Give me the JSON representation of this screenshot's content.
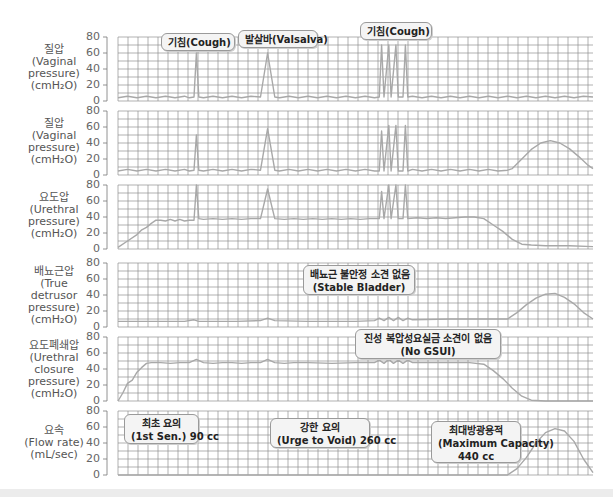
{
  "chart_data": {
    "type": "line",
    "title": "",
    "x_range": [
      0,
      100
    ],
    "grid": true,
    "panels": [
      {
        "id": "vaginal1",
        "ylabel_ko": "질압",
        "ylabel_en": [
          "(Vaginal",
          "pressure)",
          "(cmH₂O)"
        ],
        "yticks": [
          80,
          60,
          40,
          20,
          0
        ],
        "ylim": [
          0,
          80
        ],
        "points": [
          [
            0,
            4
          ],
          [
            2,
            6
          ],
          [
            4,
            4
          ],
          [
            6,
            6
          ],
          [
            8,
            4
          ],
          [
            10,
            6
          ],
          [
            12,
            4
          ],
          [
            14,
            6
          ],
          [
            15,
            4
          ],
          [
            16,
            5
          ],
          [
            16.5,
            60
          ],
          [
            17,
            5
          ],
          [
            18,
            4
          ],
          [
            20,
            6
          ],
          [
            22,
            4
          ],
          [
            24,
            6
          ],
          [
            26,
            4
          ],
          [
            28,
            6
          ],
          [
            30,
            5
          ],
          [
            31.5,
            60
          ],
          [
            33,
            5
          ],
          [
            34,
            4
          ],
          [
            36,
            6
          ],
          [
            38,
            4
          ],
          [
            40,
            6
          ],
          [
            42,
            4
          ],
          [
            44,
            6
          ],
          [
            46,
            4
          ],
          [
            48,
            6
          ],
          [
            50,
            4
          ],
          [
            52,
            6
          ],
          [
            54,
            4
          ],
          [
            55,
            5
          ],
          [
            55.5,
            70
          ],
          [
            56,
            5
          ],
          [
            57,
            70
          ],
          [
            57.5,
            5
          ],
          [
            58.5,
            70
          ],
          [
            59,
            5
          ],
          [
            60,
            5
          ],
          [
            60.5,
            70
          ],
          [
            61,
            5
          ],
          [
            62,
            6
          ],
          [
            64,
            4
          ],
          [
            66,
            6
          ],
          [
            68,
            4
          ],
          [
            70,
            6
          ],
          [
            72,
            4
          ],
          [
            74,
            6
          ],
          [
            76,
            4
          ],
          [
            78,
            6
          ],
          [
            80,
            4
          ],
          [
            82,
            6
          ],
          [
            84,
            4
          ],
          [
            86,
            6
          ],
          [
            88,
            4
          ],
          [
            90,
            6
          ],
          [
            92,
            4
          ],
          [
            94,
            6
          ],
          [
            96,
            4
          ],
          [
            98,
            6
          ],
          [
            100,
            5
          ]
        ]
      },
      {
        "id": "vaginal2",
        "ylabel_ko": "질압",
        "ylabel_en": [
          "(Vaginal",
          "pressure)",
          "(cmH₂O)"
        ],
        "yticks": [
          80,
          60,
          40,
          20,
          0
        ],
        "ylim": [
          0,
          80
        ],
        "points": [
          [
            0,
            5
          ],
          [
            2,
            7
          ],
          [
            4,
            5
          ],
          [
            6,
            7
          ],
          [
            8,
            5
          ],
          [
            10,
            7
          ],
          [
            12,
            5
          ],
          [
            14,
            7
          ],
          [
            15,
            5
          ],
          [
            16,
            6
          ],
          [
            16.5,
            50
          ],
          [
            17,
            6
          ],
          [
            18,
            5
          ],
          [
            20,
            7
          ],
          [
            22,
            5
          ],
          [
            24,
            7
          ],
          [
            26,
            5
          ],
          [
            28,
            7
          ],
          [
            30,
            6
          ],
          [
            31.5,
            58
          ],
          [
            33,
            6
          ],
          [
            34,
            5
          ],
          [
            36,
            7
          ],
          [
            38,
            5
          ],
          [
            40,
            7
          ],
          [
            42,
            5
          ],
          [
            44,
            7
          ],
          [
            46,
            5
          ],
          [
            48,
            7
          ],
          [
            50,
            5
          ],
          [
            52,
            7
          ],
          [
            54,
            5
          ],
          [
            55,
            5
          ],
          [
            55.5,
            55
          ],
          [
            56,
            5
          ],
          [
            57,
            62
          ],
          [
            57.5,
            5
          ],
          [
            58.5,
            62
          ],
          [
            59,
            5
          ],
          [
            60,
            5
          ],
          [
            60.5,
            62
          ],
          [
            61,
            5
          ],
          [
            62,
            7
          ],
          [
            64,
            5
          ],
          [
            66,
            7
          ],
          [
            68,
            5
          ],
          [
            70,
            7
          ],
          [
            72,
            5
          ],
          [
            74,
            7
          ],
          [
            76,
            5
          ],
          [
            78,
            7
          ],
          [
            80,
            5
          ],
          [
            82,
            6
          ],
          [
            83,
            8
          ],
          [
            85,
            20
          ],
          [
            87,
            32
          ],
          [
            89,
            40
          ],
          [
            91,
            43
          ],
          [
            93,
            40
          ],
          [
            95,
            33
          ],
          [
            97,
            23
          ],
          [
            99,
            12
          ],
          [
            100,
            8
          ]
        ]
      },
      {
        "id": "urethral",
        "ylabel_ko": "요도압",
        "ylabel_en": [
          "(Urethral",
          "pressure)",
          "(cmH₂O)"
        ],
        "yticks": [
          80,
          60,
          40,
          20,
          0
        ],
        "ylim": [
          0,
          80
        ],
        "points": [
          [
            0,
            2
          ],
          [
            2,
            10
          ],
          [
            4,
            18
          ],
          [
            5,
            24
          ],
          [
            6,
            27
          ],
          [
            7,
            32
          ],
          [
            8,
            36
          ],
          [
            9,
            36
          ],
          [
            10,
            35
          ],
          [
            11,
            37
          ],
          [
            12,
            35
          ],
          [
            13,
            37
          ],
          [
            14,
            35
          ],
          [
            15,
            36
          ],
          [
            16,
            36
          ],
          [
            16.5,
            80
          ],
          [
            17,
            38
          ],
          [
            18,
            37
          ],
          [
            20,
            38
          ],
          [
            22,
            37
          ],
          [
            24,
            38
          ],
          [
            26,
            37
          ],
          [
            28,
            38
          ],
          [
            30,
            38
          ],
          [
            31.5,
            75
          ],
          [
            33,
            38
          ],
          [
            35,
            37
          ],
          [
            37,
            38
          ],
          [
            39,
            37
          ],
          [
            41,
            38
          ],
          [
            43,
            37
          ],
          [
            45,
            38
          ],
          [
            47,
            37
          ],
          [
            49,
            38
          ],
          [
            51,
            37
          ],
          [
            53,
            38
          ],
          [
            55,
            38
          ],
          [
            55.5,
            72
          ],
          [
            56,
            38
          ],
          [
            57,
            80
          ],
          [
            57.5,
            38
          ],
          [
            58.5,
            80
          ],
          [
            59,
            38
          ],
          [
            60,
            38
          ],
          [
            60.5,
            80
          ],
          [
            61,
            38
          ],
          [
            63,
            39
          ],
          [
            65,
            38
          ],
          [
            67,
            39
          ],
          [
            69,
            38
          ],
          [
            71,
            39
          ],
          [
            73,
            40
          ],
          [
            75,
            40
          ],
          [
            77,
            38
          ],
          [
            79,
            30
          ],
          [
            81,
            22
          ],
          [
            83,
            12
          ],
          [
            85,
            6
          ],
          [
            87,
            5
          ],
          [
            90,
            4
          ],
          [
            95,
            4
          ],
          [
            100,
            3
          ]
        ]
      },
      {
        "id": "detrusor",
        "ylabel_ko": "배뇨근압",
        "ylabel_en": [
          "(True",
          "detrusor",
          "pressure)",
          "(cmH₂O)"
        ],
        "yticks": [
          80,
          60,
          40,
          20,
          0
        ],
        "ylim": [
          0,
          80
        ],
        "points": [
          [
            0,
            7
          ],
          [
            10,
            7
          ],
          [
            14,
            7
          ],
          [
            16,
            9
          ],
          [
            17,
            7
          ],
          [
            25,
            7
          ],
          [
            30,
            8
          ],
          [
            31.5,
            11
          ],
          [
            33,
            8
          ],
          [
            40,
            7
          ],
          [
            50,
            7
          ],
          [
            54,
            8
          ],
          [
            55,
            11
          ],
          [
            56,
            8
          ],
          [
            57,
            12
          ],
          [
            58,
            8
          ],
          [
            59,
            12
          ],
          [
            60,
            8
          ],
          [
            61,
            11
          ],
          [
            62,
            9
          ],
          [
            70,
            10
          ],
          [
            78,
            10
          ],
          [
            82,
            10
          ],
          [
            84,
            18
          ],
          [
            86,
            28
          ],
          [
            88,
            36
          ],
          [
            90,
            41
          ],
          [
            92,
            42
          ],
          [
            94,
            37
          ],
          [
            96,
            29
          ],
          [
            98,
            18
          ],
          [
            100,
            10
          ]
        ]
      },
      {
        "id": "closure",
        "ylabel_ko": "요도폐쇄압",
        "ylabel_en": [
          "(Urethral",
          "closure",
          "pressure)",
          "(cmH₂O)"
        ],
        "yticks": [
          80,
          60,
          40,
          20,
          0
        ],
        "ylim": [
          0,
          80
        ],
        "points": [
          [
            0,
            0
          ],
          [
            1,
            10
          ],
          [
            2,
            22
          ],
          [
            3,
            26
          ],
          [
            4,
            36
          ],
          [
            5,
            42
          ],
          [
            6,
            47
          ],
          [
            7,
            48
          ],
          [
            9,
            48
          ],
          [
            11,
            47
          ],
          [
            13,
            48
          ],
          [
            15,
            48
          ],
          [
            16.5,
            52
          ],
          [
            18,
            48
          ],
          [
            20,
            47
          ],
          [
            22,
            48
          ],
          [
            24,
            48
          ],
          [
            26,
            47
          ],
          [
            28,
            48
          ],
          [
            30,
            48
          ],
          [
            31.5,
            52
          ],
          [
            33,
            48
          ],
          [
            35,
            47
          ],
          [
            37,
            48
          ],
          [
            40,
            48
          ],
          [
            45,
            47
          ],
          [
            50,
            48
          ],
          [
            54,
            48
          ],
          [
            55,
            51
          ],
          [
            56,
            47
          ],
          [
            57,
            52
          ],
          [
            58,
            47
          ],
          [
            59,
            51
          ],
          [
            60,
            47
          ],
          [
            61,
            51
          ],
          [
            62,
            48
          ],
          [
            66,
            48
          ],
          [
            70,
            48
          ],
          [
            74,
            48
          ],
          [
            77,
            46
          ],
          [
            79,
            38
          ],
          [
            81,
            28
          ],
          [
            83,
            16
          ],
          [
            85,
            6
          ],
          [
            87,
            1
          ],
          [
            90,
            0
          ],
          [
            100,
            0
          ]
        ]
      },
      {
        "id": "flow",
        "ylabel_ko": "요속",
        "ylabel_en": [
          "(Flow rate)",
          "(mL/sec)"
        ],
        "yticks": [
          80,
          60,
          40,
          20,
          0
        ],
        "ylim": [
          0,
          80
        ],
        "points": [
          [
            0,
            0
          ],
          [
            82,
            0
          ],
          [
            84,
            8
          ],
          [
            86,
            22
          ],
          [
            88,
            40
          ],
          [
            90,
            53
          ],
          [
            92,
            58
          ],
          [
            94,
            55
          ],
          [
            96,
            42
          ],
          [
            98,
            20
          ],
          [
            100,
            3
          ]
        ]
      }
    ],
    "annotations": [
      {
        "panel": "vaginal1",
        "ko": "기침(Cough)",
        "en": ""
      },
      {
        "panel": "vaginal1",
        "ko": "발살바(Valsalva)",
        "en": ""
      },
      {
        "panel": "vaginal1",
        "ko": "기침(Cough)",
        "en": ""
      },
      {
        "panel": "detrusor",
        "ko": "배뇨근 불안정 소견 없음",
        "en": "(Stable Bladder)"
      },
      {
        "panel": "closure",
        "ko": "진성 복압성요실금 소견이 없음",
        "en": "(No GSUI)"
      },
      {
        "panel": "flow",
        "ko": "최초 요의",
        "en": "(1st Sen.) 90 cc"
      },
      {
        "panel": "flow",
        "ko": "강한 요의",
        "en": "(Urge to Void) 260 cc"
      },
      {
        "panel": "flow",
        "ko": "최대방광용적",
        "en": "(Maximum Capacity)",
        "extra": "440 cc"
      }
    ]
  },
  "labels": {
    "p0": {
      "ko": "질압",
      "l1": "(Vaginal",
      "l2": "pressure)",
      "l3": "(cmH₂O)"
    },
    "p1": {
      "ko": "질압",
      "l1": "(Vaginal",
      "l2": "pressure)",
      "l3": "(cmH₂O)"
    },
    "p2": {
      "ko": "요도압",
      "l1": "(Urethral",
      "l2": "pressure)",
      "l3": "(cmH₂O)"
    },
    "p3": {
      "ko": "배뇨근압",
      "l1": "(True",
      "l2": "detrusor",
      "l3": "pressure)",
      "l4": "(cmH₂O)"
    },
    "p4": {
      "ko": "요도폐쇄압",
      "l1": "(Urethral",
      "l2": "closure",
      "l3": "pressure)",
      "l4": "(cmH₂O)"
    },
    "p5": {
      "ko": "요속",
      "l1": "(Flow rate)",
      "l2": "(mL/sec)"
    }
  },
  "callouts": {
    "cough1": "기침(Cough)",
    "valsalva": "발살바(Valsalva)",
    "cough2": "기침(Cough)",
    "stable_ko": "배뇨근 불안정 소견 없음",
    "stable_en": "(Stable Bladder)",
    "gsui_ko": "진성 복압성요실금 소견이 없음",
    "gsui_en": "(No GSUI)",
    "first_ko": "최초 요의",
    "first_en": "(1st Sen.) 90 cc",
    "urge_ko": "강한 요의",
    "urge_en": "(Urge to Void) 260 cc",
    "max_ko": "최대방광용적",
    "max_en": "(Maximum Capacity)",
    "max_vol": "440 cc"
  },
  "ticks": [
    "80",
    "60",
    "40",
    "20",
    "0"
  ],
  "colors": {
    "grid": "#8f8f8f",
    "trace": "#a8a8a8",
    "axis": "#777777",
    "callout_bg": "#f4f4f4",
    "callout_border": "#9a9a9a"
  }
}
